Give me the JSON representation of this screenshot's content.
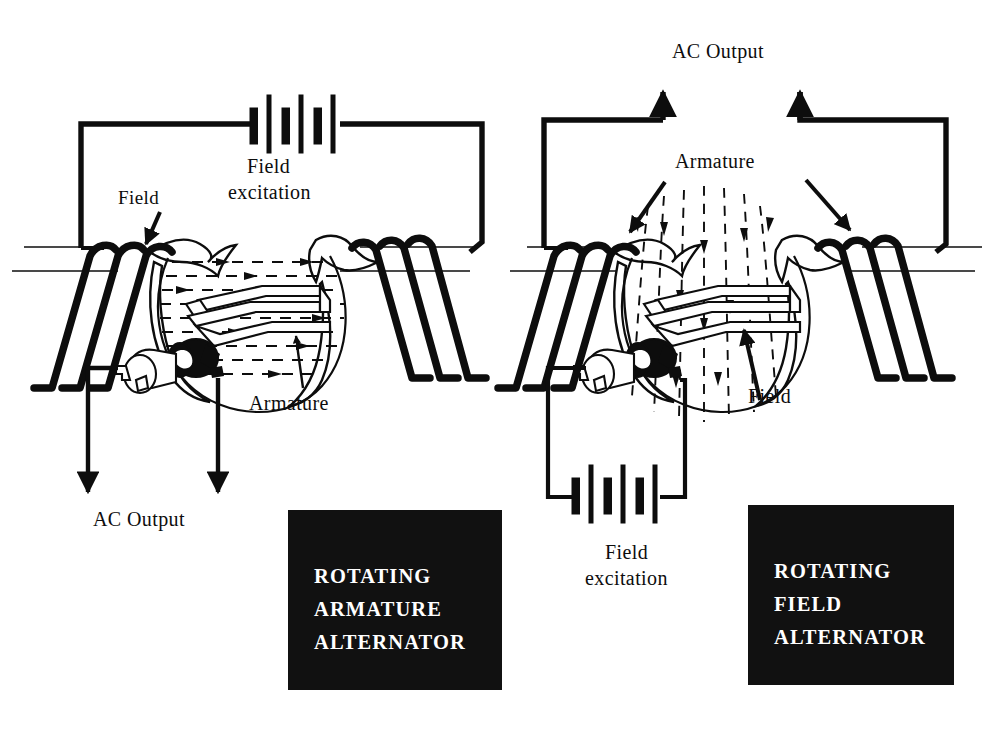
{
  "figure": {
    "type": "technical-illustration",
    "background_color": "#ffffff",
    "ink_color": "#0d0d0d",
    "plate_background": "#111111",
    "plate_text_color": "#ffffff"
  },
  "left_diagram": {
    "name": "rotating-armature-alternator",
    "caption_lines": [
      "ROTATING",
      "ARMATURE",
      "ALTERNATOR"
    ],
    "labels": {
      "field": "Field",
      "field_excitation_line1": "Field",
      "field_excitation_line2": "excitation",
      "armature": "Armature",
      "ac_output": "AC Output"
    },
    "annotations": {
      "battery_cells": 3,
      "field_coil_turns_left": 3,
      "field_coil_turns_right": 3,
      "flux_direction": "horizontal, left to right across the air gap",
      "output_arrows": 2,
      "output_arrow_direction": "down"
    }
  },
  "right_diagram": {
    "name": "rotating-field-alternator",
    "caption_lines": [
      "ROTATING",
      "FIELD",
      "ALTERNATOR"
    ],
    "labels": {
      "armature": "Armature",
      "field": "Field",
      "field_excitation_line1": "Field",
      "field_excitation_line2": "excitation",
      "ac_output": "AC Output"
    },
    "annotations": {
      "battery_cells": 3,
      "field_coil_turns_left": 3,
      "field_coil_turns_right": 3,
      "flux_direction": "vertical, downward through the rotating loop",
      "output_arrows": 2,
      "output_arrow_direction": "up"
    }
  }
}
